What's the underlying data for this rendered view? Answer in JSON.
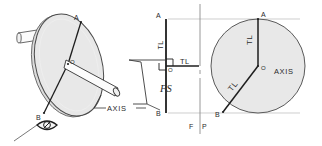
{
  "drawing": {
    "title": "Disc and axle — true length / true size construction",
    "background_color": "#ffffff",
    "line_color": "#2b2b2b",
    "thin_line_color": "#9a9a9a",
    "disc_fill_color": "#e8e8e8",
    "disc_edge_color": "#555555"
  },
  "pictorial": {
    "name": "pictorial-view",
    "point_a_label": "A",
    "point_o_label": "O",
    "point_b_label": "B",
    "axis_label": "AXIS",
    "eye_symbol": "eye-icon"
  },
  "edge_view": {
    "name": "edge-view",
    "point_a_label": "A",
    "point_o_label": "O",
    "point_b_label": "B",
    "tl_vertical_label": "TL",
    "tl_horizontal_label": "TL",
    "fs_label": "FS",
    "right_angle_marker": "right-angle-icon"
  },
  "fold_line": {
    "name": "fold-line",
    "front_label": "F",
    "profile_label": "P"
  },
  "true_size_view": {
    "name": "true-size-view",
    "point_a_label": "A",
    "point_o_label": "O",
    "point_b_label": "B",
    "axis_label": "AXIS",
    "tl_upper_label": "TL",
    "tl_lower_label": "TL"
  }
}
